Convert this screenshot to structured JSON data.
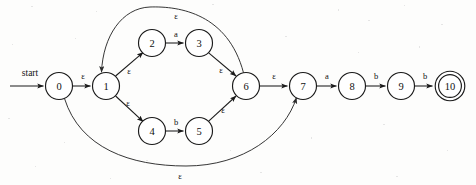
{
  "diagram": {
    "type": "nfa-state-diagram",
    "start_label": "start",
    "background_color": "#fdfdfc",
    "stroke_color": "#1a1a1a",
    "epsilon_symbol": "ε",
    "states": [
      {
        "id": "0",
        "label": "0",
        "cx": 59,
        "cy": 86,
        "r": 13.5,
        "accepting": false
      },
      {
        "id": "1",
        "label": "1",
        "cx": 106,
        "cy": 86,
        "r": 13.5,
        "accepting": false
      },
      {
        "id": "2",
        "label": "2",
        "cx": 152,
        "cy": 43,
        "r": 13.5,
        "accepting": false
      },
      {
        "id": "3",
        "label": "3",
        "cx": 199,
        "cy": 43,
        "r": 13.5,
        "accepting": false
      },
      {
        "id": "4",
        "label": "4",
        "cx": 152,
        "cy": 131,
        "r": 13.5,
        "accepting": false
      },
      {
        "id": "5",
        "label": "5",
        "cx": 199,
        "cy": 131,
        "r": 13.5,
        "accepting": false
      },
      {
        "id": "6",
        "label": "6",
        "cx": 246,
        "cy": 86,
        "r": 13.5,
        "accepting": false
      },
      {
        "id": "7",
        "label": "7",
        "cx": 303,
        "cy": 86,
        "r": 13.5,
        "accepting": false
      },
      {
        "id": "8",
        "label": "8",
        "cx": 352,
        "cy": 86,
        "r": 13.5,
        "accepting": false
      },
      {
        "id": "9",
        "label": "9",
        "cx": 401,
        "cy": 86,
        "r": 13.5,
        "accepting": false
      },
      {
        "id": "10",
        "label": "10",
        "cx": 450,
        "cy": 86,
        "r": 13.5,
        "accepting": true
      }
    ],
    "transitions": [
      {
        "id": "t-0-1",
        "from": "0",
        "to": "1",
        "label": "ε",
        "label_x": 83,
        "label_y": 76,
        "kind": "straight"
      },
      {
        "id": "t-1-2",
        "from": "1",
        "to": "2",
        "label": "ε",
        "label_x": 129,
        "label_y": 71,
        "kind": "straight"
      },
      {
        "id": "t-2-3",
        "from": "2",
        "to": "3",
        "label": "a",
        "label_x": 176,
        "label_y": 34,
        "kind": "straight"
      },
      {
        "id": "t-3-6",
        "from": "3",
        "to": "6",
        "label": "ε",
        "label_x": 221,
        "label_y": 70,
        "kind": "straight"
      },
      {
        "id": "t-1-4",
        "from": "1",
        "to": "4",
        "label": "ε",
        "label_x": 128,
        "label_y": 103,
        "kind": "straight"
      },
      {
        "id": "t-4-5",
        "from": "4",
        "to": "5",
        "label": "b",
        "label_x": 176,
        "label_y": 122,
        "kind": "straight"
      },
      {
        "id": "t-5-6",
        "from": "5",
        "to": "6",
        "label": "ε",
        "label_x": 223,
        "label_y": 110,
        "kind": "straight"
      },
      {
        "id": "t-6-1",
        "from": "6",
        "to": "1",
        "label": "ε",
        "label_x": 176,
        "label_y": 16,
        "kind": "arc-top"
      },
      {
        "id": "t-0-7",
        "from": "0",
        "to": "7",
        "label": "ε",
        "label_x": 180,
        "label_y": 176,
        "kind": "arc-bottom"
      },
      {
        "id": "t-6-7",
        "from": "6",
        "to": "7",
        "label": "ε",
        "label_x": 274,
        "label_y": 76,
        "kind": "straight"
      },
      {
        "id": "t-7-8",
        "from": "7",
        "to": "8",
        "label": "a",
        "label_x": 327,
        "label_y": 76,
        "kind": "straight"
      },
      {
        "id": "t-8-9",
        "from": "8",
        "to": "9",
        "label": "b",
        "label_x": 376,
        "label_y": 76,
        "kind": "straight"
      },
      {
        "id": "t-9-10",
        "from": "9",
        "to": "10",
        "label": "b",
        "label_x": 425,
        "label_y": 76,
        "kind": "straight"
      }
    ]
  }
}
